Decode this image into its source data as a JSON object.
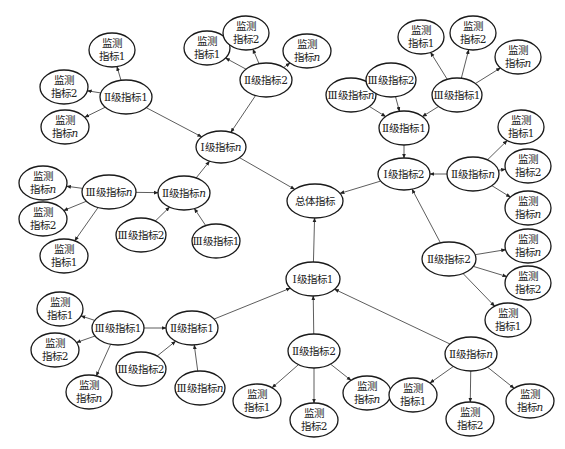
{
  "diagram": {
    "type": "hierarchical-indicator-network",
    "nodes": [
      {
        "id": "root",
        "lines": [
          "总体指标"
        ],
        "level": "total"
      },
      {
        "id": "L1n",
        "lines": [
          "Ⅰ级指标n"
        ],
        "level": "I"
      },
      {
        "id": "L1_2",
        "lines": [
          "Ⅰ级指标2"
        ],
        "level": "I"
      },
      {
        "id": "L1_1",
        "lines": [
          "Ⅰ级指标1"
        ],
        "level": "I"
      },
      {
        "id": "A_L2_1",
        "lines": [
          "Ⅱ级指标1"
        ],
        "level": "II"
      },
      {
        "id": "A_m1",
        "lines": [
          "监测",
          "指标1"
        ],
        "level": "monitor"
      },
      {
        "id": "A_m2",
        "lines": [
          "监测",
          "指标2"
        ],
        "level": "monitor"
      },
      {
        "id": "A_mn",
        "lines": [
          "监测",
          "指标n"
        ],
        "level": "monitor"
      },
      {
        "id": "B_L2_2",
        "lines": [
          "Ⅱ级指标2"
        ],
        "level": "II"
      },
      {
        "id": "B_m1",
        "lines": [
          "监测",
          "指标1"
        ],
        "level": "monitor"
      },
      {
        "id": "B_m2",
        "lines": [
          "监测",
          "指标2"
        ],
        "level": "monitor"
      },
      {
        "id": "B_mn",
        "lines": [
          "监测",
          "指标n"
        ],
        "level": "monitor"
      },
      {
        "id": "C_L2_n",
        "lines": [
          "Ⅱ级指标n"
        ],
        "level": "II"
      },
      {
        "id": "C_L3_n",
        "lines": [
          "Ⅲ级指标n"
        ],
        "level": "III"
      },
      {
        "id": "C_L3_2",
        "lines": [
          "Ⅲ级指标2"
        ],
        "level": "III"
      },
      {
        "id": "C_L3_1",
        "lines": [
          "Ⅲ级指标1"
        ],
        "level": "III"
      },
      {
        "id": "C_mn",
        "lines": [
          "监测",
          "指标n"
        ],
        "level": "monitor"
      },
      {
        "id": "C_m2",
        "lines": [
          "监测",
          "指标2"
        ],
        "level": "monitor"
      },
      {
        "id": "C_m1",
        "lines": [
          "监测",
          "指标1"
        ],
        "level": "monitor"
      },
      {
        "id": "D_L2_1",
        "lines": [
          "Ⅱ级指标1"
        ],
        "level": "II"
      },
      {
        "id": "D_L3_n",
        "lines": [
          "Ⅲ级指标n"
        ],
        "level": "III"
      },
      {
        "id": "D_L3_2",
        "lines": [
          "Ⅲ级指标2"
        ],
        "level": "III"
      },
      {
        "id": "D_L3_1",
        "lines": [
          "Ⅲ级指标1"
        ],
        "level": "III"
      },
      {
        "id": "D_m1",
        "lines": [
          "监测",
          "指标1"
        ],
        "level": "monitor"
      },
      {
        "id": "D_m2",
        "lines": [
          "监测",
          "指标2"
        ],
        "level": "monitor"
      },
      {
        "id": "D_mn",
        "lines": [
          "监测",
          "指标n"
        ],
        "level": "monitor"
      },
      {
        "id": "E_L2_n",
        "lines": [
          "Ⅱ级指标n"
        ],
        "level": "II"
      },
      {
        "id": "E_m1",
        "lines": [
          "监测",
          "指标1"
        ],
        "level": "monitor"
      },
      {
        "id": "E_m2",
        "lines": [
          "监测",
          "指标2"
        ],
        "level": "monitor"
      },
      {
        "id": "E_mn",
        "lines": [
          "监测",
          "指标n"
        ],
        "level": "monitor"
      },
      {
        "id": "F_L2_2",
        "lines": [
          "Ⅱ级指标2"
        ],
        "level": "II"
      },
      {
        "id": "F_mn",
        "lines": [
          "监测",
          "指标n"
        ],
        "level": "monitor"
      },
      {
        "id": "F_m2",
        "lines": [
          "监测",
          "指标2"
        ],
        "level": "monitor"
      },
      {
        "id": "F_m1",
        "lines": [
          "监测",
          "指标1"
        ],
        "level": "monitor"
      },
      {
        "id": "G_L2_1",
        "lines": [
          "Ⅱ级指标1"
        ],
        "level": "II"
      },
      {
        "id": "G_L3_1",
        "lines": [
          "Ⅲ级指标1"
        ],
        "level": "III"
      },
      {
        "id": "G_L3_2",
        "lines": [
          "Ⅲ级指标2"
        ],
        "level": "III"
      },
      {
        "id": "G_L3_n",
        "lines": [
          "Ⅲ级指标n"
        ],
        "level": "III"
      },
      {
        "id": "G_m1",
        "lines": [
          "监测",
          "指标1"
        ],
        "level": "monitor"
      },
      {
        "id": "G_m2",
        "lines": [
          "监测",
          "指标2"
        ],
        "level": "monitor"
      },
      {
        "id": "G_mn",
        "lines": [
          "监测",
          "指标n"
        ],
        "level": "monitor"
      },
      {
        "id": "H_L2_2",
        "lines": [
          "Ⅱ级指标2"
        ],
        "level": "II"
      },
      {
        "id": "H_m1",
        "lines": [
          "监测",
          "指标1"
        ],
        "level": "monitor"
      },
      {
        "id": "H_m2",
        "lines": [
          "监测",
          "指标2"
        ],
        "level": "monitor"
      },
      {
        "id": "H_mn",
        "lines": [
          "监测",
          "指标n"
        ],
        "level": "monitor"
      },
      {
        "id": "I_L2_n",
        "lines": [
          "Ⅱ级指标n"
        ],
        "level": "II"
      },
      {
        "id": "I_m1",
        "lines": [
          "监测",
          "指标1"
        ],
        "level": "monitor"
      },
      {
        "id": "I_m2",
        "lines": [
          "监测",
          "指标2"
        ],
        "level": "monitor"
      },
      {
        "id": "I_mn",
        "lines": [
          "监测",
          "指标n"
        ],
        "level": "monitor"
      }
    ],
    "edges": [
      {
        "from": "L1n",
        "to": "root"
      },
      {
        "from": "L1_2",
        "to": "root"
      },
      {
        "from": "L1_1",
        "to": "root"
      },
      {
        "from": "A_L2_1",
        "to": "L1n"
      },
      {
        "from": "A_L2_1",
        "to": "A_m1"
      },
      {
        "from": "A_L2_1",
        "to": "A_m2"
      },
      {
        "from": "A_L2_1",
        "to": "A_mn"
      },
      {
        "from": "B_L2_2",
        "to": "L1n"
      },
      {
        "from": "B_L2_2",
        "to": "B_m1"
      },
      {
        "from": "B_L2_2",
        "to": "B_m2"
      },
      {
        "from": "B_L2_2",
        "to": "B_mn"
      },
      {
        "from": "C_L2_n",
        "to": "L1n"
      },
      {
        "from": "C_L3_n",
        "to": "C_L2_n"
      },
      {
        "from": "C_L3_2",
        "to": "C_L2_n"
      },
      {
        "from": "C_L3_1",
        "to": "C_L2_n"
      },
      {
        "from": "C_L3_n",
        "to": "C_mn"
      },
      {
        "from": "C_L3_n",
        "to": "C_m2"
      },
      {
        "from": "C_L3_n",
        "to": "C_m1"
      },
      {
        "from": "D_L2_1",
        "to": "L1_2"
      },
      {
        "from": "D_L3_n",
        "to": "D_L2_1"
      },
      {
        "from": "D_L3_2",
        "to": "D_L2_1"
      },
      {
        "from": "D_L3_1",
        "to": "D_L2_1"
      },
      {
        "from": "D_L3_1",
        "to": "D_m1"
      },
      {
        "from": "D_L3_1",
        "to": "D_m2"
      },
      {
        "from": "D_L3_1",
        "to": "D_mn"
      },
      {
        "from": "E_L2_n",
        "to": "L1_2"
      },
      {
        "from": "E_L2_n",
        "to": "E_m1"
      },
      {
        "from": "E_L2_n",
        "to": "E_m2"
      },
      {
        "from": "E_L2_n",
        "to": "E_mn"
      },
      {
        "from": "F_L2_2",
        "to": "L1_2"
      },
      {
        "from": "F_L2_2",
        "to": "F_mn"
      },
      {
        "from": "F_L2_2",
        "to": "F_m2"
      },
      {
        "from": "F_L2_2",
        "to": "F_m1"
      },
      {
        "from": "G_L2_1",
        "to": "L1_1"
      },
      {
        "from": "G_L3_1",
        "to": "G_L2_1"
      },
      {
        "from": "G_L3_2",
        "to": "G_L2_1"
      },
      {
        "from": "G_L3_n",
        "to": "G_L2_1"
      },
      {
        "from": "G_L3_1",
        "to": "G_m1"
      },
      {
        "from": "G_L3_1",
        "to": "G_m2"
      },
      {
        "from": "G_L3_1",
        "to": "G_mn"
      },
      {
        "from": "H_L2_2",
        "to": "L1_1"
      },
      {
        "from": "H_L2_2",
        "to": "H_m1"
      },
      {
        "from": "H_L2_2",
        "to": "H_m2"
      },
      {
        "from": "H_L2_2",
        "to": "H_mn"
      },
      {
        "from": "I_L2_n",
        "to": "L1_1"
      },
      {
        "from": "I_L2_n",
        "to": "I_m1"
      },
      {
        "from": "I_L2_n",
        "to": "I_m2"
      },
      {
        "from": "I_L2_n",
        "to": "I_mn"
      }
    ]
  }
}
